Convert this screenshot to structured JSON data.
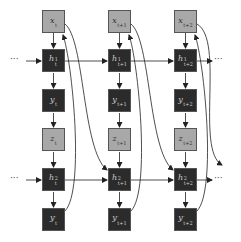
{
  "diagram": {
    "type": "unrolled two-layer recurrent network",
    "colors": {
      "input_node": "#a8a8a8",
      "hidden_node": "#2b2b2b",
      "edge": "#222222",
      "background": "#ffffff"
    },
    "ellipsis": "···",
    "columns": [
      {
        "x": {
          "base": "x",
          "sub": "t",
          "sup": ""
        },
        "h1": {
          "base": "h",
          "sub": "t",
          "sup": "1"
        },
        "y": {
          "base": "y",
          "sub": "t",
          "sup": ""
        },
        "z": {
          "base": "z",
          "sub": "t",
          "sup": ""
        },
        "h2": {
          "base": "h",
          "sub": "t",
          "sup": "2"
        },
        "yp": {
          "base": "y",
          "sub": "t",
          "sup": "′"
        }
      },
      {
        "x": {
          "base": "x",
          "sub": "t+1",
          "sup": ""
        },
        "h1": {
          "base": "h",
          "sub": "t+1",
          "sup": "1"
        },
        "y": {
          "base": "y",
          "sub": "t+1",
          "sup": ""
        },
        "z": {
          "base": "z",
          "sub": "t+1",
          "sup": ""
        },
        "h2": {
          "base": "h",
          "sub": "t+1",
          "sup": "2"
        },
        "yp": {
          "base": "y",
          "sub": "t+1",
          "sup": "′"
        }
      },
      {
        "x": {
          "base": "x",
          "sub": "t+2",
          "sup": ""
        },
        "h1": {
          "base": "h",
          "sub": "t+2",
          "sup": "1"
        },
        "y": {
          "base": "y",
          "sub": "t+2",
          "sup": ""
        },
        "z": {
          "base": "z",
          "sub": "t+2",
          "sup": ""
        },
        "h2": {
          "base": "h",
          "sub": "t+2",
          "sup": "2"
        },
        "yp": {
          "base": "y",
          "sub": "t+2",
          "sup": "′"
        }
      }
    ]
  }
}
